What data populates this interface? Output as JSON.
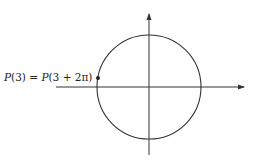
{
  "diagram": {
    "type": "unit-circle",
    "point_label": {
      "left_fn": "P",
      "left_arg": "(3)",
      "equals": " = ",
      "right_fn": "P",
      "right_arg": "(3 + 2π)"
    },
    "colors": {
      "stroke": "#333333",
      "text": "#222222"
    }
  }
}
